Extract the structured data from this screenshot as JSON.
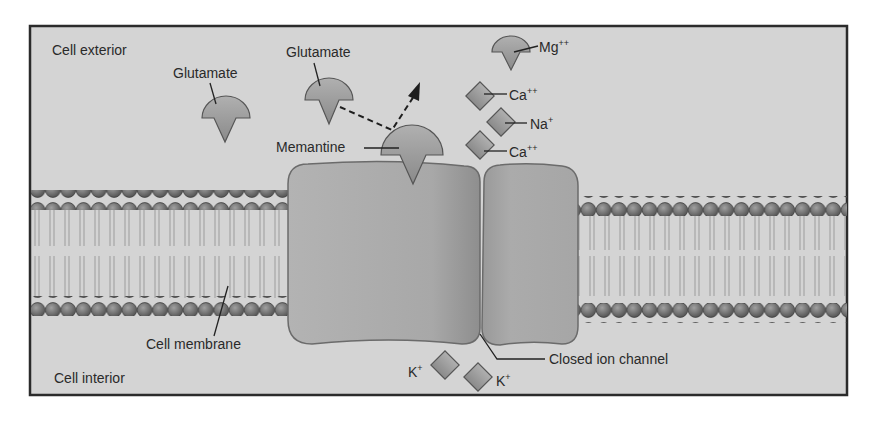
{
  "diagram": {
    "regions": {
      "exterior": "Cell exterior",
      "interior": "Cell interior"
    },
    "labels": {
      "glutamate_1": "Glutamate",
      "glutamate_2": "Glutamate",
      "memantine": "Memantine",
      "mg": "Mg",
      "mg_charge": "++",
      "ca_1": "Ca",
      "ca_1_charge": "++",
      "na": "Na",
      "na_charge": "+",
      "ca_2": "Ca",
      "ca_2_charge": "++",
      "k_1": "K",
      "k_1_charge": "+",
      "k_2": "K",
      "k_2_charge": "+",
      "cell_membrane": "Cell membrane",
      "closed_channel": "Closed ion channel"
    },
    "colors": {
      "background": "#d4d4d4",
      "frame": "#2b2b2b",
      "channel": "#a9a9a9",
      "channel_stroke": "#6b6b6b",
      "molecule": "#9c9c9c",
      "lipid_head": "#6e6e6e",
      "lipid_tail": "#9a9a9a"
    }
  }
}
